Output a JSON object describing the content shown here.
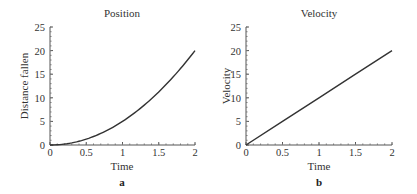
{
  "chart_data": [
    {
      "type": "line",
      "panel_label": "a",
      "title": "Position",
      "xlabel": "Time",
      "ylabel": "Distance fallen",
      "xlim": [
        0,
        2
      ],
      "ylim": [
        0,
        25
      ],
      "xticks": [
        "0",
        "0.5",
        "1",
        "1.5",
        "2"
      ],
      "yticks": [
        "0",
        "5",
        "10",
        "15",
        "20",
        "25"
      ],
      "grid": false,
      "series": [
        {
          "name": "Position",
          "x": [
            0,
            0.25,
            0.5,
            0.75,
            1,
            1.25,
            1.5,
            1.75,
            2
          ],
          "y": [
            0,
            0.3125,
            1.25,
            2.8125,
            5,
            7.8125,
            11.25,
            15.3125,
            20
          ]
        }
      ]
    },
    {
      "type": "line",
      "panel_label": "b",
      "title": "Velocity",
      "xlabel": "Time",
      "ylabel": "Velocity",
      "xlim": [
        0,
        2
      ],
      "ylim": [
        0,
        25
      ],
      "xticks": [
        "0",
        "0.5",
        "1",
        "1.5",
        "2"
      ],
      "yticks": [
        "0",
        "5",
        "10",
        "15",
        "20",
        "25"
      ],
      "grid": false,
      "series": [
        {
          "name": "Velocity",
          "x": [
            0,
            0.5,
            1,
            1.5,
            2
          ],
          "y": [
            0,
            5,
            10,
            15,
            20
          ]
        }
      ]
    }
  ],
  "colors": {
    "line": "#333333",
    "axis": "#555555"
  }
}
